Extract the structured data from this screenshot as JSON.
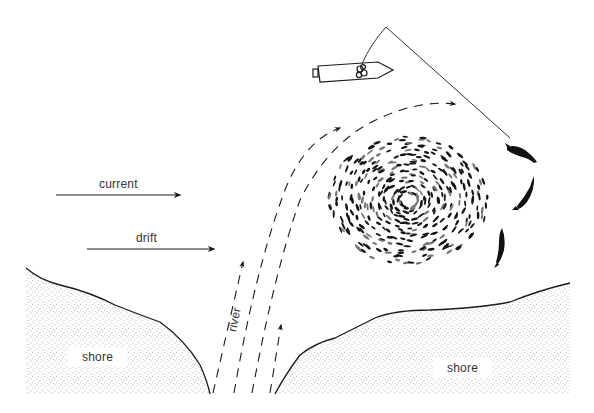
{
  "diagram": {
    "type": "illustration",
    "labels": {
      "current": "current",
      "drift": "drift",
      "river": "river",
      "shore_left": "shore",
      "shore_right": "shore"
    },
    "elements": {
      "boat": "boat with angler casting a line",
      "fishing_line": "line from boat to fish",
      "school": "large oval school of small fish",
      "predator_fish_count": 3,
      "river_flow_lines": 4,
      "current_arrow": "horizontal arrow pointing right",
      "drift_arrow": "horizontal arrow pointing right"
    },
    "colors": {
      "ink": "#1a1a1a",
      "background": "#ffffff",
      "stipple": "#555555"
    }
  }
}
